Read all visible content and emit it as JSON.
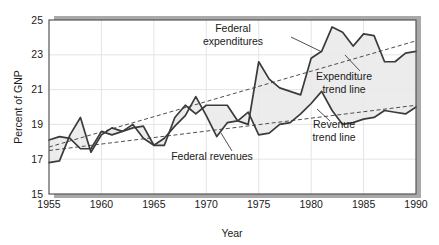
{
  "chart_data": {
    "type": "line",
    "title": "",
    "xlabel": "Year",
    "ylabel": "Percent of GNP",
    "xlim": [
      1955,
      1990
    ],
    "ylim": [
      15,
      25
    ],
    "xticks": [
      1955,
      1960,
      1965,
      1970,
      1975,
      1980,
      1985,
      1990
    ],
    "yticks": [
      15,
      17,
      19,
      21,
      23,
      25
    ],
    "grid": true,
    "legend_position": "inline-annotations",
    "x": [
      1955,
      1956,
      1957,
      1958,
      1959,
      1960,
      1961,
      1962,
      1963,
      1964,
      1965,
      1966,
      1967,
      1968,
      1969,
      1970,
      1971,
      1972,
      1973,
      1974,
      1975,
      1976,
      1977,
      1978,
      1979,
      1980,
      1981,
      1982,
      1983,
      1984,
      1985,
      1986,
      1987,
      1988,
      1989,
      1990
    ],
    "series": [
      {
        "name": "Federal expenditures",
        "color": "#3b3b3b",
        "values": [
          16.8,
          16.9,
          18.4,
          19.4,
          17.4,
          18.4,
          18.8,
          18.6,
          18.8,
          18.9,
          17.8,
          17.8,
          19.4,
          20.1,
          19.6,
          20.1,
          20.1,
          20.1,
          19.2,
          19.0,
          22.6,
          21.6,
          21.1,
          20.9,
          20.7,
          22.8,
          23.2,
          24.6,
          24.3,
          23.5,
          24.2,
          24.1,
          22.6,
          22.6,
          23.1,
          23.2
        ]
      },
      {
        "name": "Federal revenues",
        "color": "#3b3b3b",
        "values": [
          18.1,
          18.3,
          18.2,
          17.6,
          17.6,
          18.6,
          18.4,
          18.6,
          19.0,
          18.2,
          17.8,
          18.2,
          18.9,
          19.5,
          20.6,
          19.5,
          18.3,
          19.1,
          19.2,
          19.7,
          18.4,
          18.5,
          19.0,
          19.1,
          19.6,
          20.2,
          20.9,
          19.8,
          19.0,
          19.1,
          19.3,
          19.4,
          19.8,
          19.7,
          19.6,
          20.0
        ]
      }
    ],
    "trend_lines": [
      {
        "name": "Expenditure trend line",
        "x": [
          1955,
          1990
        ],
        "y": [
          17.7,
          23.8
        ],
        "style": "dashed"
      },
      {
        "name": "Revenue trend line",
        "x": [
          1955,
          1990
        ],
        "y": [
          17.5,
          20.1
        ],
        "style": "dashed"
      }
    ],
    "annotations": [
      {
        "name": "federal-expenditures-label",
        "text_lines": [
          "Federal",
          "expenditures"
        ],
        "text": "Federal expenditures",
        "x": 233,
        "y": 32
      },
      {
        "name": "expenditure-trend-line-label",
        "text_lines": [
          "Expenditure",
          "trend line"
        ],
        "text": "Expenditure trend line",
        "x": 344,
        "y": 80
      },
      {
        "name": "revenue-trend-line-label",
        "text_lines": [
          "Revenue",
          "trend line"
        ],
        "text": "Revenue trend line",
        "x": 334,
        "y": 128
      },
      {
        "name": "federal-revenues-label",
        "text_lines": [
          "Federal revenues"
        ],
        "text": "Federal revenues",
        "x": 212,
        "y": 160
      }
    ]
  },
  "axes": {
    "y_label": "Percent of GNP",
    "x_label": "Year",
    "y_tick_labels": [
      "25",
      "23",
      "21",
      "19",
      "17",
      "15"
    ],
    "x_tick_labels": [
      "1955",
      "1960",
      "1965",
      "1970",
      "1975",
      "1980",
      "1985",
      "1990"
    ]
  },
  "colors": {
    "line": "#3b3b3b",
    "fill": "#e9e9e9",
    "frame": "#555555",
    "shadow": "#a9a9a9",
    "grid": "#dddddd",
    "text": "#1a1a1a"
  }
}
